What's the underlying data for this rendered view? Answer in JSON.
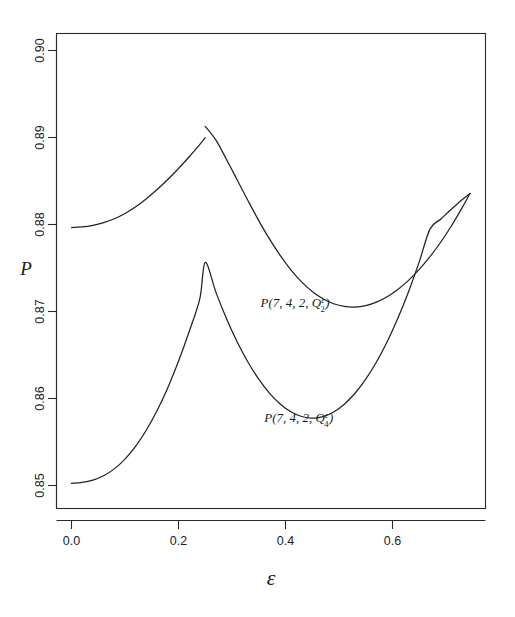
{
  "chart_data": {
    "type": "line",
    "title": "",
    "xlabel": "ε",
    "ylabel": "P",
    "xlim": [
      -0.028,
      0.775
    ],
    "ylim": [
      0.8465,
      0.9005
    ],
    "grid": false,
    "legend_position": "inline-annotation",
    "xticks": [
      0.0,
      0.2,
      0.4,
      0.6
    ],
    "xtick_labels": [
      "0.0",
      "0.2",
      "0.4",
      "0.6"
    ],
    "yticks": [
      0.85,
      0.86,
      0.87,
      0.88,
      0.89,
      0.9
    ],
    "ytick_labels": [
      "0.85",
      "0.86",
      "0.87",
      "0.88",
      "0.89",
      "0.90"
    ],
    "series": [
      {
        "name": "P(7, 4, 2, Q^e_2)",
        "label_base": "P(7, 4, 2, Q",
        "label_sup": "ε",
        "label_sub": "2",
        "label_close": ")",
        "label_x": 0.418,
        "label_y": 0.8705,
        "x": [
          0.0,
          0.02,
          0.04,
          0.06,
          0.08,
          0.1,
          0.12,
          0.14,
          0.16,
          0.18,
          0.2,
          0.22,
          0.24,
          0.25,
          0.25,
          0.27,
          0.29,
          0.31,
          0.33,
          0.35,
          0.37,
          0.39,
          0.41,
          0.43,
          0.45,
          0.47,
          0.49,
          0.51,
          0.53,
          0.55,
          0.57,
          0.59,
          0.61,
          0.63,
          0.65,
          0.67,
          0.69,
          0.71,
          0.73,
          0.745
        ],
        "y": [
          0.87965,
          0.87972,
          0.87991,
          0.88022,
          0.88066,
          0.88127,
          0.88204,
          0.88297,
          0.88402,
          0.88518,
          0.88644,
          0.88779,
          0.88922,
          0.88998,
          0.89128,
          0.88969,
          0.88745,
          0.88509,
          0.88273,
          0.88045,
          0.87834,
          0.87644,
          0.87479,
          0.87341,
          0.8723,
          0.87146,
          0.87089,
          0.87058,
          0.87051,
          0.87068,
          0.87108,
          0.8717,
          0.87254,
          0.87358,
          0.87484,
          0.8763,
          0.87796,
          0.87983,
          0.88191,
          0.88357
        ]
      },
      {
        "name": "P(7, 4, 2, Q^e_4)",
        "label_base": "P(7, 4, 2, Q",
        "label_sup": "ε",
        "label_sub": "4",
        "label_close": ")",
        "label_x": 0.425,
        "label_y": 0.8573,
        "x": [
          0.0,
          0.02,
          0.04,
          0.06,
          0.08,
          0.1,
          0.12,
          0.14,
          0.16,
          0.18,
          0.2,
          0.22,
          0.24,
          0.25,
          0.27,
          0.29,
          0.31,
          0.33,
          0.35,
          0.37,
          0.39,
          0.41,
          0.43,
          0.45,
          0.47,
          0.49,
          0.51,
          0.53,
          0.55,
          0.57,
          0.59,
          0.61,
          0.63,
          0.65,
          0.67,
          0.69,
          0.71,
          0.73,
          0.745
        ],
        "y": [
          0.85025,
          0.85035,
          0.85062,
          0.85112,
          0.85191,
          0.85303,
          0.85452,
          0.85638,
          0.85862,
          0.86125,
          0.86428,
          0.8677,
          0.87152,
          0.87565,
          0.8722,
          0.86915,
          0.86647,
          0.86417,
          0.86222,
          0.86062,
          0.85937,
          0.85847,
          0.85793,
          0.85774,
          0.85792,
          0.85845,
          0.85935,
          0.8606,
          0.86222,
          0.86419,
          0.86653,
          0.86922,
          0.87228,
          0.8757,
          0.87947,
          0.88061,
          0.88175,
          0.88285,
          0.88357
        ]
      }
    ]
  },
  "figure": {
    "background_color": "#ffffff",
    "line_color": "#222222",
    "axis_color": "#2a2a2a"
  }
}
